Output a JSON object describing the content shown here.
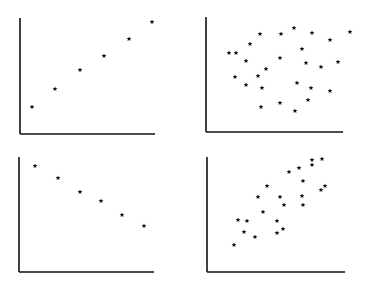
{
  "chart_data": [
    {
      "type": "scatter",
      "title": "",
      "xlabel": "",
      "ylabel": "",
      "description": "Perfect positive linear relationship",
      "marker": "star",
      "axes": {
        "x0": 20,
        "y0": 134,
        "top": 18,
        "right": 155
      },
      "points": [
        [
          12,
          27
        ],
        [
          35,
          45
        ],
        [
          60,
          64
        ],
        [
          84,
          78
        ],
        [
          109,
          95
        ],
        [
          132,
          112
        ]
      ]
    },
    {
      "type": "scatter",
      "title": "",
      "xlabel": "",
      "ylabel": "",
      "description": "No correlation (random scatter)",
      "marker": "star",
      "axes": {
        "x0": 206,
        "y0": 132,
        "top": 17,
        "right": 343
      },
      "points": [
        [
          30,
          79
        ],
        [
          44,
          88
        ],
        [
          54,
          98
        ],
        [
          75,
          98
        ],
        [
          88,
          104
        ],
        [
          106,
          99
        ],
        [
          124,
          92
        ],
        [
          96,
          83
        ],
        [
          144,
          100
        ],
        [
          23,
          79
        ],
        [
          40,
          71
        ],
        [
          60,
          63
        ],
        [
          74,
          74
        ],
        [
          100,
          69
        ],
        [
          115,
          65
        ],
        [
          132,
          70
        ],
        [
          29,
          55
        ],
        [
          40,
          47
        ],
        [
          52,
          56
        ],
        [
          91,
          49
        ],
        [
          105,
          44
        ],
        [
          124,
          41
        ],
        [
          56,
          44
        ],
        [
          55,
          25
        ],
        [
          74,
          29
        ],
        [
          89,
          21
        ],
        [
          102,
          32
        ]
      ]
    },
    {
      "type": "scatter",
      "title": "",
      "xlabel": "",
      "ylabel": "",
      "description": "Perfect negative linear relationship",
      "marker": "star",
      "axes": {
        "x0": 19,
        "y0": 272,
        "top": 157,
        "right": 154
      },
      "points": [
        [
          16,
          106
        ],
        [
          39,
          94
        ],
        [
          61,
          80
        ],
        [
          82,
          71
        ],
        [
          103,
          57
        ],
        [
          125,
          46
        ]
      ]
    },
    {
      "type": "scatter",
      "title": "",
      "xlabel": "",
      "ylabel": "",
      "description": "Moderate positive correlation",
      "marker": "star",
      "axes": {
        "x0": 207,
        "y0": 272,
        "top": 157,
        "right": 345
      },
      "points": [
        [
          27,
          27
        ],
        [
          37,
          40
        ],
        [
          31,
          52
        ],
        [
          40,
          51
        ],
        [
          48,
          35
        ],
        [
          56,
          60
        ],
        [
          51,
          75
        ],
        [
          60,
          86
        ],
        [
          70,
          51
        ],
        [
          76,
          43
        ],
        [
          73,
          75
        ],
        [
          77,
          67
        ],
        [
          82,
          100
        ],
        [
          92,
          104
        ],
        [
          95,
          76
        ],
        [
          96,
          67
        ],
        [
          96,
          91
        ],
        [
          105,
          107
        ],
        [
          105,
          112
        ],
        [
          114,
          82
        ],
        [
          115,
          113
        ],
        [
          118,
          86
        ],
        [
          70,
          39
        ]
      ]
    }
  ]
}
